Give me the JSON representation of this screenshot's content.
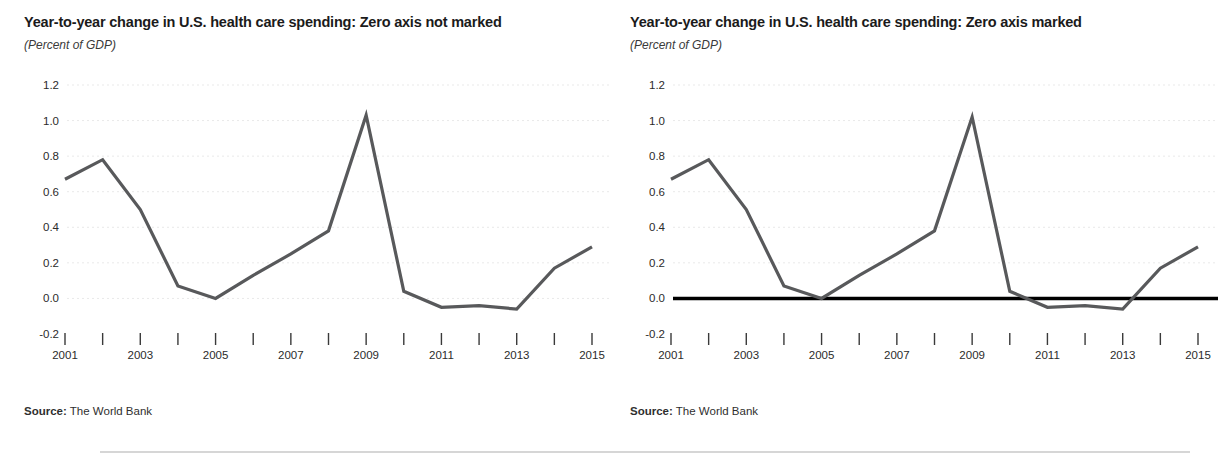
{
  "figure": {
    "source_label": "Source:",
    "source_value": "The World Bank"
  },
  "panels": [
    {
      "title": "Year-to-year change in U.S. health care spending: Zero axis not marked",
      "subtitle": "(Percent of GDP)",
      "zero_axis_marked": false
    },
    {
      "title": "Year-to-year change in U.S. health care spending: Zero axis marked",
      "subtitle": "(Percent of GDP)",
      "zero_axis_marked": true
    }
  ],
  "chart_data": [
    {
      "type": "line",
      "title": "Year-to-year change in U.S. health care spending: Zero axis not marked",
      "subtitle": "(Percent of GDP)",
      "xlabel": "",
      "ylabel": "Percent of GDP",
      "ylim": [
        -0.2,
        1.2
      ],
      "ytick_labels": [
        "1.2",
        "1.0",
        "0.8",
        "0.6",
        "0.4",
        "0.2",
        "0.0",
        "-0.2"
      ],
      "ytick_values": [
        1.2,
        1.0,
        0.8,
        0.6,
        0.4,
        0.2,
        0.0,
        -0.2
      ],
      "xlim": [
        2001,
        2015
      ],
      "x": [
        2001,
        2002,
        2003,
        2004,
        2005,
        2006,
        2007,
        2008,
        2009,
        2010,
        2011,
        2012,
        2013,
        2014,
        2015
      ],
      "xtick_values": [
        2001,
        2002,
        2003,
        2004,
        2005,
        2006,
        2007,
        2008,
        2009,
        2010,
        2011,
        2012,
        2013,
        2014,
        2015
      ],
      "xtick_labels": [
        "2001",
        "",
        "2003",
        "",
        "2005",
        "",
        "2007",
        "",
        "2009",
        "",
        "2011",
        "",
        "2013",
        "",
        "2015"
      ],
      "values": [
        0.67,
        0.78,
        0.5,
        0.07,
        0.0,
        0.13,
        0.25,
        0.38,
        1.03,
        0.04,
        -0.05,
        -0.04,
        -0.06,
        0.17,
        0.29
      ],
      "grid": true,
      "legend": "none",
      "zero_axis_marked": false,
      "line_color": "#58595b",
      "source": "Source: The World Bank"
    },
    {
      "type": "line",
      "title": "Year-to-year change in U.S. health care spending: Zero axis marked",
      "subtitle": "(Percent of GDP)",
      "xlabel": "",
      "ylabel": "Percent of GDP",
      "ylim": [
        -0.2,
        1.2
      ],
      "ytick_labels": [
        "1.2",
        "1.0",
        "0.8",
        "0.6",
        "0.4",
        "0.2",
        "0.0",
        "-0.2"
      ],
      "ytick_values": [
        1.2,
        1.0,
        0.8,
        0.6,
        0.4,
        0.2,
        0.0,
        -0.2
      ],
      "xlim": [
        2001,
        2015
      ],
      "x": [
        2001,
        2002,
        2003,
        2004,
        2005,
        2006,
        2007,
        2008,
        2009,
        2010,
        2011,
        2012,
        2013,
        2014,
        2015
      ],
      "xtick_values": [
        2001,
        2002,
        2003,
        2004,
        2005,
        2006,
        2007,
        2008,
        2009,
        2010,
        2011,
        2012,
        2013,
        2014,
        2015
      ],
      "xtick_labels": [
        "2001",
        "",
        "2003",
        "",
        "2005",
        "",
        "2007",
        "",
        "2009",
        "",
        "2011",
        "",
        "2013",
        "",
        "2015"
      ],
      "values": [
        0.67,
        0.78,
        0.5,
        0.07,
        0.0,
        0.13,
        0.25,
        0.38,
        1.02,
        0.04,
        -0.05,
        -0.04,
        -0.06,
        0.17,
        0.29
      ],
      "grid": true,
      "legend": "none",
      "zero_axis_marked": true,
      "zero_axis_color": "#000000",
      "line_color": "#58595b",
      "source": "Source: The World Bank"
    }
  ]
}
